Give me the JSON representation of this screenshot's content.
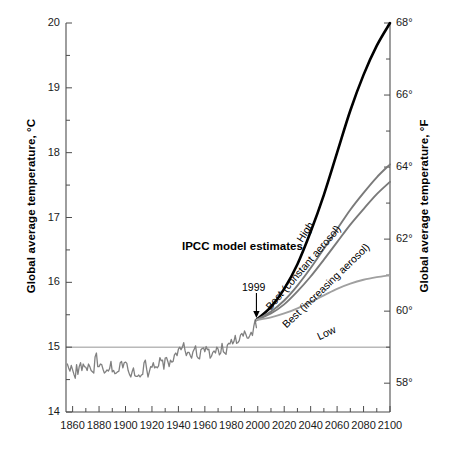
{
  "chart_data": {
    "type": "line",
    "title": "",
    "xlabel": "",
    "ylabel": "Global average temperature, °C",
    "ylabel_right": "Global average temperature, °F",
    "xlim": [
      1855,
      2100
    ],
    "ylim": [
      14,
      20
    ],
    "ylim_right": [
      57.2,
      68
    ],
    "grid": false,
    "gridline_at": 15,
    "legend_position": "inline-annotations",
    "xticks": [
      1860,
      1880,
      1900,
      1920,
      1940,
      1960,
      1980,
      2000,
      2020,
      2040,
      2060,
      2080,
      2100
    ],
    "xtick_labels": [
      "1860",
      "1880",
      "1900",
      "1920",
      "1940",
      "1960",
      "1980",
      "2000",
      "2020",
      "2040",
      "2060",
      "2080",
      "2100"
    ],
    "xminor_step": 10,
    "yticks": [
      14,
      15,
      16,
      17,
      18,
      19,
      20
    ],
    "ytick_labels": [
      "14",
      "15",
      "16",
      "17",
      "18",
      "19",
      "20"
    ],
    "yminor_step": 0.5,
    "yticks_right": [
      58,
      60,
      62,
      64,
      66,
      68
    ],
    "ytick_labels_right": [
      "58°",
      "60°",
      "62°",
      "64°",
      "66°",
      "68°"
    ],
    "yminor_step_right": 1,
    "annotations": [
      {
        "name": "ipcc-note",
        "text": "IPCC model estimates",
        "bold": true
      },
      {
        "name": "year-marker",
        "text": "1999",
        "points_to_year": 1999,
        "points_to_value": 15.42
      }
    ],
    "branch_point": {
      "x": 1999,
      "y": 15.42
    },
    "series": [
      {
        "name": "observed",
        "label": "",
        "color": "#808080",
        "width": 1.3,
        "x": [
          1856,
          1857,
          1858,
          1859,
          1860,
          1861,
          1862,
          1863,
          1864,
          1865,
          1866,
          1867,
          1868,
          1869,
          1870,
          1871,
          1872,
          1873,
          1874,
          1875,
          1876,
          1877,
          1878,
          1879,
          1880,
          1881,
          1882,
          1883,
          1884,
          1885,
          1886,
          1887,
          1888,
          1889,
          1890,
          1891,
          1892,
          1893,
          1894,
          1895,
          1896,
          1897,
          1898,
          1899,
          1900,
          1901,
          1902,
          1903,
          1904,
          1905,
          1906,
          1907,
          1908,
          1909,
          1910,
          1911,
          1912,
          1913,
          1914,
          1915,
          1916,
          1917,
          1918,
          1919,
          1920,
          1921,
          1922,
          1923,
          1924,
          1925,
          1926,
          1927,
          1928,
          1929,
          1930,
          1931,
          1932,
          1933,
          1934,
          1935,
          1936,
          1937,
          1938,
          1939,
          1940,
          1941,
          1942,
          1943,
          1944,
          1945,
          1946,
          1947,
          1948,
          1949,
          1950,
          1951,
          1952,
          1953,
          1954,
          1955,
          1956,
          1957,
          1958,
          1959,
          1960,
          1961,
          1962,
          1963,
          1964,
          1965,
          1966,
          1967,
          1968,
          1969,
          1970,
          1971,
          1972,
          1973,
          1974,
          1975,
          1976,
          1977,
          1978,
          1979,
          1980,
          1981,
          1982,
          1983,
          1984,
          1985,
          1986,
          1987,
          1988,
          1989,
          1990,
          1991,
          1992,
          1993,
          1994,
          1995,
          1996,
          1997,
          1998,
          1999
        ],
        "y": [
          14.74,
          14.68,
          14.63,
          14.72,
          14.65,
          14.58,
          14.52,
          14.73,
          14.58,
          14.7,
          14.76,
          14.64,
          14.74,
          14.7,
          14.69,
          14.64,
          14.74,
          14.7,
          14.64,
          14.62,
          14.6,
          14.85,
          14.91,
          14.7,
          14.7,
          14.74,
          14.73,
          14.66,
          14.6,
          14.62,
          14.65,
          14.63,
          14.67,
          14.78,
          14.62,
          14.64,
          14.59,
          14.6,
          14.62,
          14.63,
          14.76,
          14.78,
          14.68,
          14.76,
          14.77,
          14.75,
          14.64,
          14.58,
          14.54,
          14.62,
          14.68,
          14.56,
          14.55,
          14.55,
          14.57,
          14.54,
          14.57,
          14.58,
          14.76,
          14.8,
          14.66,
          14.54,
          14.62,
          14.7,
          14.69,
          14.76,
          14.68,
          14.7,
          14.68,
          14.71,
          14.84,
          14.79,
          14.8,
          14.66,
          14.83,
          14.84,
          14.78,
          14.7,
          14.8,
          14.77,
          14.78,
          14.88,
          14.91,
          14.87,
          14.97,
          15.0,
          14.96,
          15.0,
          15.07,
          14.95,
          14.87,
          14.92,
          14.92,
          14.87,
          14.83,
          14.93,
          14.97,
          15.02,
          14.86,
          14.83,
          14.82,
          14.96,
          14.98,
          14.99,
          14.93,
          15.01,
          14.96,
          14.97,
          14.83,
          14.86,
          14.92,
          14.94,
          14.91,
          15.0,
          14.97,
          14.88,
          14.91,
          15.06,
          14.93,
          14.91,
          14.89,
          15.03,
          15.06,
          15.05,
          15.12,
          15.05,
          15.09,
          15.18,
          15.06,
          15.07,
          15.1,
          15.19,
          15.21,
          15.17,
          15.25,
          15.2,
          15.14,
          15.14,
          15.18,
          15.23,
          15.18,
          15.32,
          15.42,
          15.3
        ]
      },
      {
        "name": "high",
        "label": "High",
        "color": "#000000",
        "width": 2.6,
        "x": [
          1999,
          2010,
          2020,
          2030,
          2040,
          2050,
          2060,
          2070,
          2080,
          2090,
          2100
        ],
        "y": [
          15.42,
          15.62,
          15.9,
          16.28,
          16.78,
          17.35,
          18.0,
          18.65,
          19.2,
          19.65,
          20.0
        ]
      },
      {
        "name": "best-constant-aerosol",
        "label": "Best (constant aerosol)",
        "color": "#7a7a7a",
        "width": 1.9,
        "x": [
          1999,
          2010,
          2020,
          2030,
          2040,
          2050,
          2060,
          2070,
          2080,
          2090,
          2100
        ],
        "y": [
          15.42,
          15.55,
          15.72,
          15.95,
          16.22,
          16.52,
          16.82,
          17.12,
          17.38,
          17.62,
          17.82
        ]
      },
      {
        "name": "best-increasing-aerosol",
        "label": "Best (increasing aerosol)",
        "color": "#7a7a7a",
        "width": 1.9,
        "x": [
          1999,
          2010,
          2020,
          2030,
          2040,
          2050,
          2060,
          2070,
          2080,
          2090,
          2100
        ],
        "y": [
          15.42,
          15.52,
          15.66,
          15.86,
          16.09,
          16.35,
          16.62,
          16.89,
          17.13,
          17.36,
          17.55
        ]
      },
      {
        "name": "low",
        "label": "Low",
        "color": "#a0a0a0",
        "width": 1.9,
        "x": [
          1999,
          2010,
          2020,
          2030,
          2040,
          2050,
          2060,
          2070,
          2080,
          2090,
          2100
        ],
        "y": [
          15.42,
          15.46,
          15.52,
          15.6,
          15.7,
          15.8,
          15.9,
          15.98,
          16.04,
          16.08,
          16.11
        ]
      }
    ]
  },
  "labels": {
    "ylabel_left": "Global average temperature, °C",
    "ylabel_right": "Global average temperature, °F",
    "ipcc_note": "IPCC model estimates",
    "year_marker": "1999",
    "curve_high": "High",
    "curve_best_constant": "Best (constant aerosol)",
    "curve_best_increasing": "Best (increasing aerosol)",
    "curve_low": "Low"
  },
  "colors": {
    "axis": "#4d4d4d",
    "observed": "#808080",
    "high": "#000000",
    "best": "#7a7a7a",
    "low": "#a0a0a0",
    "background": "#ffffff"
  }
}
